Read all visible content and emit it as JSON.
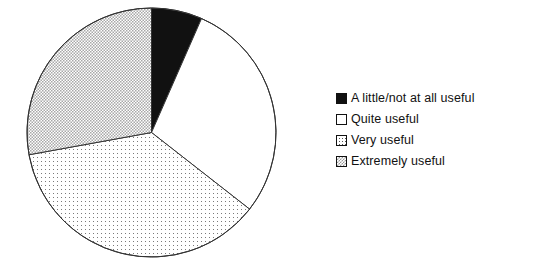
{
  "chart_data": {
    "type": "pie",
    "title": "",
    "subtitle": "",
    "xlabel": "",
    "ylabel": "",
    "grid": false,
    "legend_position": "right",
    "start_angle_deg": 0,
    "direction": "clockwise",
    "categories": [
      "A little/not at all useful",
      "Quite useful",
      "Very useful",
      "Extremely useful"
    ],
    "values": [
      6.6,
      29.0,
      36.6,
      27.8
    ],
    "units": "percent",
    "slices": [
      {
        "label": "A little/not at all useful",
        "value": 6.6,
        "start_deg": 0,
        "end_deg": 23.7,
        "sweep_deg": 23.7,
        "fill": "solid-black",
        "color": "#111111"
      },
      {
        "label": "Quite useful",
        "value": 29.0,
        "start_deg": 23.7,
        "end_deg": 128.0,
        "sweep_deg": 104.3,
        "fill": "empty-white",
        "color": "#ffffff"
      },
      {
        "label": "Very useful",
        "value": 36.6,
        "start_deg": 128.0,
        "end_deg": 259.7,
        "sweep_deg": 131.7,
        "fill": "sparse-dots",
        "color": "#ffffff"
      },
      {
        "label": "Extremely useful",
        "value": 27.8,
        "start_deg": 259.7,
        "end_deg": 360.0,
        "sweep_deg": 100.3,
        "fill": "dense-checker",
        "color": "#e0e0e0"
      }
    ],
    "geometry": {
      "center_x": 151.5,
      "center_y": 132.5,
      "radius": 124.5
    },
    "stroke_color": "#333333"
  },
  "legend": {
    "items": [
      {
        "label": "A little/not at all useful",
        "swatch": "solid-black"
      },
      {
        "label": "Quite useful",
        "swatch": "empty-white"
      },
      {
        "label": "Very useful",
        "swatch": "sparse-dots"
      },
      {
        "label": "Extremely useful",
        "swatch": "dense-checker"
      }
    ]
  }
}
